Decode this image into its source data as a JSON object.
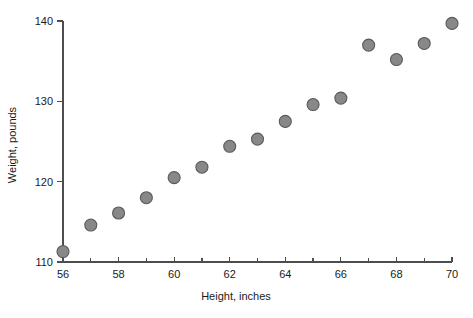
{
  "chart_data": {
    "type": "scatter",
    "title": "",
    "xlabel": "Height, inches",
    "ylabel": "Weight, pounds",
    "xlim": [
      56,
      70
    ],
    "ylim": [
      110,
      140
    ],
    "grid": false,
    "legend": null,
    "x_ticks_major": [
      56,
      58,
      60,
      62,
      64,
      66,
      68,
      70
    ],
    "x_ticks_minor": [
      57,
      59,
      61,
      63,
      65,
      67,
      69
    ],
    "y_ticks_major": [
      110,
      120,
      130,
      140
    ],
    "x_tick_labels": [
      "56",
      "58",
      "60",
      "62",
      "64",
      "66",
      "68",
      "70"
    ],
    "y_tick_labels": [
      "110",
      "120",
      "130",
      "140"
    ],
    "marker": {
      "shape": "circle",
      "fill_color": "#888888",
      "edge_color": "#595959",
      "radius_px": 6
    },
    "x": [
      56,
      57,
      58,
      59,
      60,
      61,
      62,
      63,
      64,
      65,
      66,
      67,
      68,
      69,
      70
    ],
    "values": [
      111.3,
      114.6,
      116.1,
      118.0,
      120.5,
      121.8,
      124.4,
      125.3,
      127.5,
      129.6,
      130.4,
      137.0,
      135.2,
      137.2,
      139.7
    ],
    "points": [
      {
        "x": 56,
        "y": 111.3
      },
      {
        "x": 57,
        "y": 114.6
      },
      {
        "x": 58,
        "y": 116.1
      },
      {
        "x": 59,
        "y": 118.0
      },
      {
        "x": 60,
        "y": 120.5
      },
      {
        "x": 61,
        "y": 121.8
      },
      {
        "x": 62,
        "y": 124.4
      },
      {
        "x": 63,
        "y": 125.3
      },
      {
        "x": 64,
        "y": 127.5
      },
      {
        "x": 65,
        "y": 129.6
      },
      {
        "x": 66,
        "y": 130.4
      },
      {
        "x": 67,
        "y": 137.0
      },
      {
        "x": 68,
        "y": 135.2
      },
      {
        "x": 69,
        "y": 137.2
      },
      {
        "x": 70,
        "y": 139.7
      }
    ]
  }
}
